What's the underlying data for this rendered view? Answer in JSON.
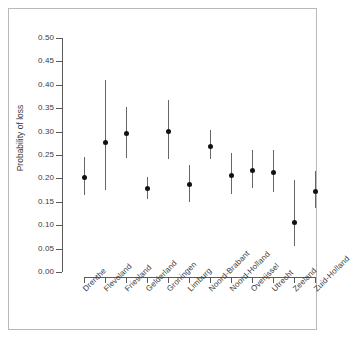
{
  "figure": {
    "border_color": "#b9b9b9",
    "background": "#ffffff"
  },
  "axis": {
    "y_title": "Probability of loss",
    "y_ticks": [
      "0.00",
      "0.05",
      "0.10",
      "0.15",
      "0.20",
      "0.25",
      "0.30",
      "0.35",
      "0.40",
      "0.45",
      "0.50"
    ]
  },
  "chart_data": {
    "type": "scatter",
    "title": "",
    "xlabel": "",
    "ylabel": "Probability of loss",
    "ylim": [
      0.0,
      0.5
    ],
    "ytick_step": 0.05,
    "grid": false,
    "legend": null,
    "error_bars": true,
    "error_bar_style": "vertical-line-with-point",
    "point_color": "#111111",
    "whisker_color": "#666666",
    "categories": [
      "Drenthe",
      "Flevoland",
      "Friesland",
      "Gelderland",
      "Groningen",
      "Limburg",
      "Noord-Brabant",
      "Noord-Holland",
      "Overijssel",
      "Utrecht",
      "Zeeland",
      "Zuid-Holland"
    ],
    "values": [
      0.204,
      0.278,
      0.296,
      0.179,
      0.301,
      0.187,
      0.27,
      0.208,
      0.218,
      0.214,
      0.106,
      0.173
    ],
    "lower": [
      0.165,
      0.176,
      0.243,
      0.155,
      0.241,
      0.15,
      0.241,
      0.167,
      0.179,
      0.171,
      0.056,
      0.137
    ],
    "upper": [
      0.246,
      0.41,
      0.353,
      0.203,
      0.367,
      0.229,
      0.303,
      0.254,
      0.261,
      0.26,
      0.197,
      0.215
    ],
    "points": [
      {
        "category": "Drenthe",
        "value": 0.204,
        "lower": 0.165,
        "upper": 0.246
      },
      {
        "category": "Flevoland",
        "value": 0.278,
        "lower": 0.176,
        "upper": 0.41
      },
      {
        "category": "Friesland",
        "value": 0.296,
        "lower": 0.243,
        "upper": 0.353
      },
      {
        "category": "Gelderland",
        "value": 0.179,
        "lower": 0.155,
        "upper": 0.203
      },
      {
        "category": "Groningen",
        "value": 0.301,
        "lower": 0.241,
        "upper": 0.367
      },
      {
        "category": "Limburg",
        "value": 0.187,
        "lower": 0.15,
        "upper": 0.229
      },
      {
        "category": "Noord-Brabant",
        "value": 0.27,
        "lower": 0.241,
        "upper": 0.303
      },
      {
        "category": "Noord-Holland",
        "value": 0.208,
        "lower": 0.167,
        "upper": 0.254
      },
      {
        "category": "Overijssel",
        "value": 0.218,
        "lower": 0.179,
        "upper": 0.261
      },
      {
        "category": "Utrecht",
        "value": 0.214,
        "lower": 0.171,
        "upper": 0.26
      },
      {
        "category": "Zeeland",
        "value": 0.106,
        "lower": 0.056,
        "upper": 0.197
      },
      {
        "category": "Zuid-Holland",
        "value": 0.173,
        "lower": 0.137,
        "upper": 0.215
      }
    ]
  }
}
